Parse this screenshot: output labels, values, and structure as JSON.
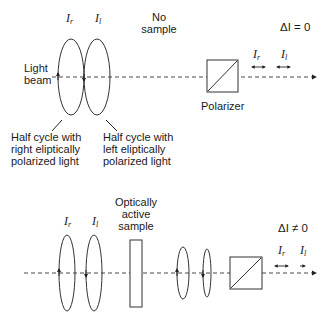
{
  "top_panel": {
    "intensity_right_label": "I",
    "intensity_right_sub": "r",
    "intensity_left_label": "I",
    "intensity_left_sub": "l",
    "no_sample_line1": "No",
    "no_sample_line2": "sample",
    "light_beam_line1": "Light",
    "light_beam_line2": "beam",
    "polarizer_label": "Polarizer",
    "delta_label": "ΔI = 0",
    "output_right_label": "I",
    "output_right_sub": "r",
    "output_left_label": "I",
    "output_left_sub": "l",
    "caption_right": [
      "Half cycle with",
      "right eliptically",
      "polarized light"
    ],
    "caption_left": [
      "Half cycle with",
      "left eliptically",
      "polarized light"
    ]
  },
  "bottom_panel": {
    "intensity_right_label": "I",
    "intensity_right_sub": "r",
    "intensity_left_label": "I",
    "intensity_left_sub": "l",
    "sample_line1": "Optically",
    "sample_line2": "active",
    "sample_line3": "sample",
    "delta_label": "ΔI ≠ 0",
    "output_right_label": "I",
    "output_right_sub": "r",
    "output_left_label": "I",
    "output_left_sub": "l"
  },
  "colors": {
    "stroke": "#333333",
    "background": "#ffffff"
  }
}
